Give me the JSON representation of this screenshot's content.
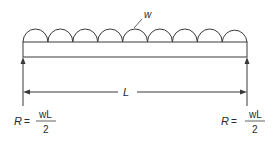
{
  "diagram": {
    "type": "simply-supported-beam-uniform-load",
    "load_label": "w",
    "span_label": "L",
    "arc_count": 9,
    "reactions": [
      {
        "side": "left",
        "symbol": "R",
        "equals": "=",
        "numerator": "wL",
        "denominator": "2"
      },
      {
        "side": "right",
        "symbol": "R",
        "equals": "=",
        "numerator": "wL",
        "denominator": "2"
      }
    ]
  },
  "colors": {
    "stroke": "#3a3a3a",
    "background": "#ffffff"
  }
}
